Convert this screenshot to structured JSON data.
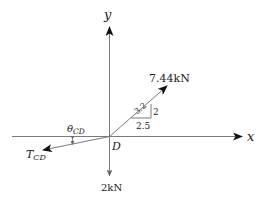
{
  "diagram": {
    "type": "free-body-diagram",
    "origin_label": "D",
    "axes": {
      "x_label": "x",
      "y_label": "y"
    },
    "forces": [
      {
        "id": "force-744",
        "label": "7.44kN",
        "direction": "up-right"
      },
      {
        "id": "force-2kN",
        "label": "2kN",
        "direction": "down"
      },
      {
        "id": "tension-cd",
        "label_main": "T",
        "label_sub": "CD",
        "direction": "down-left"
      }
    ],
    "slope_triangle": {
      "hypotenuse": "3.2",
      "rise": "2",
      "run": "2.5"
    },
    "angle": {
      "label_main": "θ",
      "label_sub": "CD"
    }
  },
  "colors": {
    "line": "#7a7a7a",
    "arrowhead": "#111111",
    "text": "#222222",
    "background": "#ffffff"
  }
}
